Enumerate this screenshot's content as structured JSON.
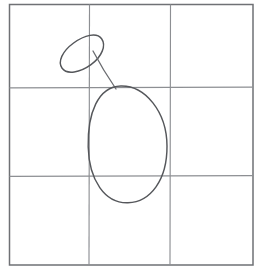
{
  "document": {
    "title": "Proportion grid sketch",
    "media": "pencil line drawing",
    "background_color": "#ffffff",
    "width": 262,
    "height": 272
  },
  "grid": {
    "name": "three-by-three proportion grid",
    "columns": 3,
    "rows": 3,
    "color": "#8d8f93",
    "border_color": "#6f7175",
    "border": {
      "left": 9,
      "top": 4,
      "right": 253,
      "bottom": 265
    },
    "vertical_line_x": [
      89.5,
      170.5
    ],
    "horizontal_line_y": [
      87.5,
      176.0
    ]
  },
  "figure": {
    "name": "two-ellipse gesture construction",
    "stroke_color": "#55575b",
    "shapes": [
      {
        "id": "head-ellipse",
        "label": "small tilted ellipse",
        "cx": 81,
        "cy": 54,
        "rx": 26,
        "ry": 17,
        "rotation_deg": -36
      },
      {
        "id": "body-ellipse",
        "label": "large vertical ellipse",
        "cx": 127,
        "cy": 144,
        "rx": 40,
        "ry": 59,
        "rotation_deg": 9
      },
      {
        "id": "neck-line",
        "label": "connecting line",
        "x1": 93,
        "y1": 51,
        "x2": 116,
        "y2": 89
      }
    ]
  }
}
